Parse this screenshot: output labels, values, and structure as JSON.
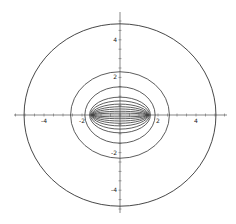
{
  "chart_data": {
    "type": "contour",
    "title": "",
    "xlabel": "",
    "ylabel": "",
    "xlim": [
      -5.6,
      5.6
    ],
    "ylim": [
      -5.4,
      5.4
    ],
    "grid": false,
    "x_ticks": [
      -4,
      -2,
      2,
      4
    ],
    "y_ticks": [
      4,
      2,
      -2,
      -4
    ],
    "x_tick_labels": [
      "-4",
      "-2",
      "2",
      "4"
    ],
    "y_tick_labels": [
      "4",
      "2",
      "-2",
      "-4"
    ],
    "minor_ticks_per_unit": 2,
    "contours": [
      {
        "rx": 5.05,
        "ry": 4.85
      },
      {
        "rx": 2.6,
        "ry": 2.3
      },
      {
        "rx": 1.85,
        "ry": 1.5
      },
      {
        "rx": 1.6,
        "ry": 0.95
      },
      {
        "rx": 1.55,
        "ry": 0.75
      },
      {
        "rx": 1.5,
        "ry": 0.58
      },
      {
        "rx": 1.47,
        "ry": 0.44
      },
      {
        "rx": 1.45,
        "ry": 0.32
      },
      {
        "rx": 1.43,
        "ry": 0.2
      },
      {
        "rx": 1.42,
        "ry": 0.1
      }
    ],
    "line_color": "#333333",
    "axis_color": "#555555"
  }
}
